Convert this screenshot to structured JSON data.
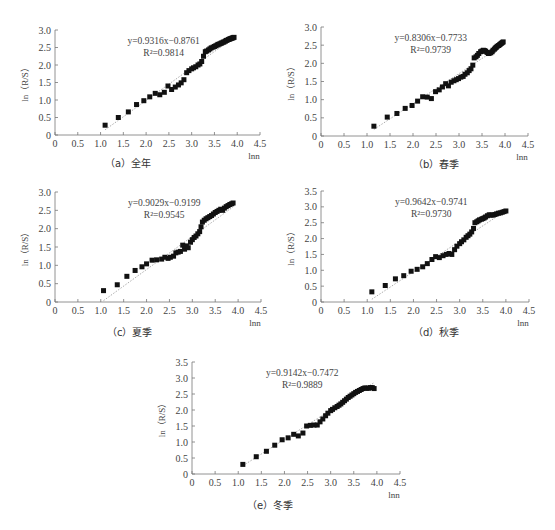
{
  "chart_data": [
    {
      "id": "a",
      "type": "scatter",
      "caption": "（a）全年",
      "xlabel": "lnn",
      "ylabel": "ln（R/S）",
      "xlim": [
        0,
        4.5
      ],
      "ylim": [
        0,
        3.0
      ],
      "xticks": [
        "0",
        "0.5",
        "1.0",
        "1.5",
        "2.0",
        "2.5",
        "3.0",
        "3.5",
        "4.0",
        "4.5"
      ],
      "yticks": [
        "0",
        "0.5",
        "1.0",
        "1.5",
        "2.0",
        "2.5",
        "3.0"
      ],
      "equation": "y=0.9316x−0.8761",
      "r2": "R²=0.9814",
      "fit": {
        "slope": 0.9316,
        "intercept": -0.8761
      },
      "points": [
        [
          1.1,
          0.28
        ],
        [
          1.39,
          0.5
        ],
        [
          1.61,
          0.66
        ],
        [
          1.79,
          0.87
        ],
        [
          1.95,
          0.98
        ],
        [
          2.08,
          1.09
        ],
        [
          2.2,
          1.19
        ],
        [
          2.3,
          1.15
        ],
        [
          2.4,
          1.22
        ],
        [
          2.48,
          1.4
        ],
        [
          2.56,
          1.3
        ],
        [
          2.64,
          1.37
        ],
        [
          2.71,
          1.43
        ],
        [
          2.77,
          1.49
        ],
        [
          2.83,
          1.58
        ],
        [
          2.89,
          1.78
        ],
        [
          2.94,
          1.84
        ],
        [
          3.0,
          1.89
        ],
        [
          3.04,
          1.92
        ],
        [
          3.09,
          1.95
        ],
        [
          3.14,
          2.0
        ],
        [
          3.18,
          2.03
        ],
        [
          3.22,
          2.1
        ],
        [
          3.26,
          2.25
        ],
        [
          3.3,
          2.38
        ],
        [
          3.33,
          2.4
        ],
        [
          3.37,
          2.43
        ],
        [
          3.4,
          2.46
        ],
        [
          3.43,
          2.49
        ],
        [
          3.47,
          2.51
        ],
        [
          3.5,
          2.53
        ],
        [
          3.53,
          2.55
        ],
        [
          3.56,
          2.57
        ],
        [
          3.58,
          2.59
        ],
        [
          3.61,
          2.6
        ],
        [
          3.64,
          2.62
        ],
        [
          3.66,
          2.63
        ],
        [
          3.69,
          2.65
        ],
        [
          3.71,
          2.66
        ],
        [
          3.74,
          2.68
        ],
        [
          3.76,
          2.7
        ],
        [
          3.78,
          2.71
        ],
        [
          3.81,
          2.73
        ],
        [
          3.83,
          2.74
        ],
        [
          3.85,
          2.75
        ],
        [
          3.87,
          2.76
        ],
        [
          3.89,
          2.77
        ],
        [
          3.91,
          2.78
        ],
        [
          3.93,
          2.79
        ]
      ]
    },
    {
      "id": "b",
      "type": "scatter",
      "caption": "（b）春季",
      "xlabel": "lnn",
      "ylabel": "ln（R/S）",
      "xlim": [
        0,
        4.5
      ],
      "ylim": [
        0,
        3.0
      ],
      "xticks": [
        "0",
        "0.5",
        "1.0",
        "1.5",
        "2.0",
        "2.5",
        "3.0",
        "3.5",
        "4.0",
        "4.5"
      ],
      "yticks": [
        "0",
        "0.5",
        "1.0",
        "1.5",
        "2.0",
        "2.5",
        "3.0"
      ],
      "equation": "y=0.8306x−0.7733",
      "r2": "R²=0.9739",
      "fit": {
        "slope": 0.8306,
        "intercept": -0.7733
      },
      "points": [
        [
          1.15,
          0.27
        ],
        [
          1.44,
          0.52
        ],
        [
          1.65,
          0.62
        ],
        [
          1.83,
          0.76
        ],
        [
          1.98,
          0.84
        ],
        [
          2.1,
          0.96
        ],
        [
          2.21,
          1.08
        ],
        [
          2.31,
          1.07
        ],
        [
          2.4,
          1.03
        ],
        [
          2.49,
          1.22
        ],
        [
          2.57,
          1.27
        ],
        [
          2.64,
          1.35
        ],
        [
          2.71,
          1.44
        ],
        [
          2.77,
          1.38
        ],
        [
          2.83,
          1.48
        ],
        [
          2.89,
          1.52
        ],
        [
          2.94,
          1.55
        ],
        [
          2.99,
          1.58
        ],
        [
          3.04,
          1.62
        ],
        [
          3.09,
          1.64
        ],
        [
          3.13,
          1.7
        ],
        [
          3.18,
          1.74
        ],
        [
          3.22,
          1.8
        ],
        [
          3.26,
          1.85
        ],
        [
          3.3,
          1.95
        ],
        [
          3.33,
          2.15
        ],
        [
          3.37,
          2.18
        ],
        [
          3.4,
          2.22
        ],
        [
          3.43,
          2.27
        ],
        [
          3.47,
          2.32
        ],
        [
          3.5,
          2.34
        ],
        [
          3.53,
          2.36
        ],
        [
          3.56,
          2.35
        ],
        [
          3.58,
          2.33
        ],
        [
          3.61,
          2.3
        ],
        [
          3.64,
          2.27
        ],
        [
          3.66,
          2.28
        ],
        [
          3.69,
          2.29
        ],
        [
          3.72,
          2.32
        ],
        [
          3.74,
          2.36
        ],
        [
          3.77,
          2.39
        ],
        [
          3.79,
          2.42
        ],
        [
          3.81,
          2.44
        ],
        [
          3.83,
          2.47
        ],
        [
          3.86,
          2.49
        ],
        [
          3.88,
          2.51
        ],
        [
          3.9,
          2.53
        ],
        [
          3.92,
          2.55
        ],
        [
          3.94,
          2.57
        ],
        [
          3.96,
          2.59
        ]
      ]
    },
    {
      "id": "c",
      "type": "scatter",
      "caption": "（c）夏季",
      "xlabel": "lnn",
      "ylabel": "ln（R/S）",
      "xlim": [
        0,
        4.5
      ],
      "ylim": [
        0,
        3.0
      ],
      "xticks": [
        "0",
        "0.5",
        "1.0",
        "1.5",
        "2.0",
        "2.5",
        "3.0",
        "3.5",
        "4.0",
        "4.5"
      ],
      "yticks": [
        "0",
        "0.5",
        "1.0",
        "1.5",
        "2.0",
        "2.5",
        "3.0"
      ],
      "equation": "y=0.9029x−0.9199",
      "r2": "R²=0.9545",
      "fit": {
        "slope": 0.9029,
        "intercept": -0.9199
      },
      "points": [
        [
          1.06,
          0.31
        ],
        [
          1.36,
          0.47
        ],
        [
          1.57,
          0.7
        ],
        [
          1.75,
          0.86
        ],
        [
          1.9,
          0.96
        ],
        [
          2.0,
          1.04
        ],
        [
          2.12,
          1.14
        ],
        [
          2.22,
          1.15
        ],
        [
          2.33,
          1.17
        ],
        [
          2.4,
          1.22
        ],
        [
          2.47,
          1.19
        ],
        [
          2.52,
          1.22
        ],
        [
          2.59,
          1.25
        ],
        [
          2.64,
          1.34
        ],
        [
          2.69,
          1.36
        ],
        [
          2.74,
          1.38
        ],
        [
          2.79,
          1.55
        ],
        [
          2.83,
          1.44
        ],
        [
          2.87,
          1.53
        ],
        [
          2.91,
          1.48
        ],
        [
          2.96,
          1.63
        ],
        [
          3.0,
          1.7
        ],
        [
          3.04,
          1.76
        ],
        [
          3.08,
          1.8
        ],
        [
          3.12,
          1.86
        ],
        [
          3.16,
          1.92
        ],
        [
          3.19,
          2.05
        ],
        [
          3.22,
          2.18
        ],
        [
          3.26,
          2.23
        ],
        [
          3.3,
          2.27
        ],
        [
          3.34,
          2.3
        ],
        [
          3.38,
          2.33
        ],
        [
          3.42,
          2.36
        ],
        [
          3.46,
          2.4
        ],
        [
          3.5,
          2.44
        ],
        [
          3.54,
          2.47
        ],
        [
          3.58,
          2.5
        ],
        [
          3.62,
          2.53
        ],
        [
          3.66,
          2.5
        ],
        [
          3.7,
          2.56
        ],
        [
          3.74,
          2.6
        ],
        [
          3.78,
          2.63
        ],
        [
          3.82,
          2.66
        ],
        [
          3.86,
          2.68
        ],
        [
          3.89,
          2.7
        ]
      ]
    },
    {
      "id": "d",
      "type": "scatter",
      "caption": "（d）秋季",
      "xlabel": "lnn",
      "ylabel": "ln（R/S）",
      "xlim": [
        0,
        4.5
      ],
      "ylim": [
        0,
        3.5
      ],
      "xticks": [
        "0",
        "0.5",
        "1.0",
        "1.5",
        "2.0",
        "2.5",
        "3.0",
        "3.5",
        "4.0",
        "4.5"
      ],
      "yticks": [
        "0",
        "0.5",
        "1.0",
        "1.5",
        "2.0",
        "2.5",
        "3.0",
        "3.5"
      ],
      "equation": "y=0.9642x−0.9741",
      "r2": "R²=0.9730",
      "fit": {
        "slope": 0.9642,
        "intercept": -0.9741
      },
      "points": [
        [
          1.1,
          0.32
        ],
        [
          1.39,
          0.52
        ],
        [
          1.61,
          0.73
        ],
        [
          1.79,
          0.83
        ],
        [
          1.95,
          0.97
        ],
        [
          2.08,
          1.03
        ],
        [
          2.2,
          1.11
        ],
        [
          2.3,
          1.21
        ],
        [
          2.4,
          1.34
        ],
        [
          2.48,
          1.43
        ],
        [
          2.56,
          1.4
        ],
        [
          2.64,
          1.46
        ],
        [
          2.71,
          1.5
        ],
        [
          2.77,
          1.53
        ],
        [
          2.83,
          1.5
        ],
        [
          2.89,
          1.65
        ],
        [
          2.94,
          1.76
        ],
        [
          3.0,
          1.84
        ],
        [
          3.04,
          1.9
        ],
        [
          3.09,
          1.96
        ],
        [
          3.14,
          2.04
        ],
        [
          3.18,
          2.09
        ],
        [
          3.22,
          2.14
        ],
        [
          3.26,
          2.21
        ],
        [
          3.3,
          2.32
        ],
        [
          3.33,
          2.5
        ],
        [
          3.37,
          2.53
        ],
        [
          3.4,
          2.56
        ],
        [
          3.43,
          2.59
        ],
        [
          3.47,
          2.61
        ],
        [
          3.5,
          2.63
        ],
        [
          3.53,
          2.65
        ],
        [
          3.56,
          2.68
        ],
        [
          3.6,
          2.72
        ],
        [
          3.64,
          2.75
        ],
        [
          3.68,
          2.74
        ],
        [
          3.72,
          2.74
        ],
        [
          3.76,
          2.76
        ],
        [
          3.8,
          2.78
        ],
        [
          3.84,
          2.8
        ],
        [
          3.88,
          2.81
        ],
        [
          3.92,
          2.83
        ],
        [
          3.96,
          2.85
        ],
        [
          4.0,
          2.87
        ]
      ]
    },
    {
      "id": "e",
      "type": "scatter",
      "caption": "（e）冬季",
      "xlabel": "lnn",
      "ylabel": "ln（R/S）",
      "xlim": [
        0,
        4.5
      ],
      "ylim": [
        0,
        3.5
      ],
      "xticks": [
        "0",
        "0.5",
        "1.0",
        "1.5",
        "2.0",
        "2.5",
        "3.0",
        "3.5",
        "4.0",
        "4.5"
      ],
      "yticks": [
        "0",
        "0.5",
        "1.0",
        "1.5",
        "2.0",
        "2.5",
        "3.0",
        "3.5"
      ],
      "equation": "y=0.9142x−0.7472",
      "r2": "R²=0.9889",
      "fit": {
        "slope": 0.9142,
        "intercept": -0.7472
      },
      "points": [
        [
          1.1,
          0.3
        ],
        [
          1.39,
          0.54
        ],
        [
          1.61,
          0.71
        ],
        [
          1.79,
          0.9
        ],
        [
          1.95,
          1.07
        ],
        [
          2.08,
          1.13
        ],
        [
          2.2,
          1.24
        ],
        [
          2.3,
          1.19
        ],
        [
          2.4,
          1.28
        ],
        [
          2.48,
          1.5
        ],
        [
          2.56,
          1.52
        ],
        [
          2.64,
          1.53
        ],
        [
          2.71,
          1.53
        ],
        [
          2.77,
          1.63
        ],
        [
          2.83,
          1.72
        ],
        [
          2.89,
          1.82
        ],
        [
          2.94,
          1.9
        ],
        [
          3.0,
          1.98
        ],
        [
          3.04,
          2.02
        ],
        [
          3.09,
          2.07
        ],
        [
          3.14,
          2.11
        ],
        [
          3.18,
          2.15
        ],
        [
          3.22,
          2.19
        ],
        [
          3.26,
          2.24
        ],
        [
          3.3,
          2.29
        ],
        [
          3.34,
          2.34
        ],
        [
          3.38,
          2.39
        ],
        [
          3.42,
          2.43
        ],
        [
          3.46,
          2.47
        ],
        [
          3.5,
          2.51
        ],
        [
          3.54,
          2.55
        ],
        [
          3.58,
          2.58
        ],
        [
          3.62,
          2.61
        ],
        [
          3.66,
          2.64
        ],
        [
          3.7,
          2.67
        ],
        [
          3.74,
          2.69
        ],
        [
          3.78,
          2.68
        ],
        [
          3.82,
          2.68
        ],
        [
          3.86,
          2.7
        ],
        [
          3.9,
          2.7
        ],
        [
          3.94,
          2.67
        ]
      ]
    }
  ],
  "layout": {
    "panels": [
      {
        "id": "a",
        "origin": [
          55,
          135
        ],
        "xEnd": 260,
        "yTop": 30,
        "captionPos": [
          105,
          155
        ]
      },
      {
        "id": "b",
        "origin": [
          321,
          136
        ],
        "xEnd": 528,
        "yTop": 27,
        "captionPos": [
          413,
          156
        ]
      },
      {
        "id": "c",
        "origin": [
          55,
          302
        ],
        "xEnd": 261,
        "yTop": 192,
        "captionPos": [
          107,
          324
        ]
      },
      {
        "id": "d",
        "origin": [
          321,
          302
        ],
        "xEnd": 529,
        "yTop": 191,
        "captionPos": [
          413,
          324
        ]
      },
      {
        "id": "e",
        "origin": [
          192,
          474
        ],
        "xEnd": 400,
        "yTop": 362,
        "captionPos": [
          247,
          497
        ]
      }
    ]
  }
}
